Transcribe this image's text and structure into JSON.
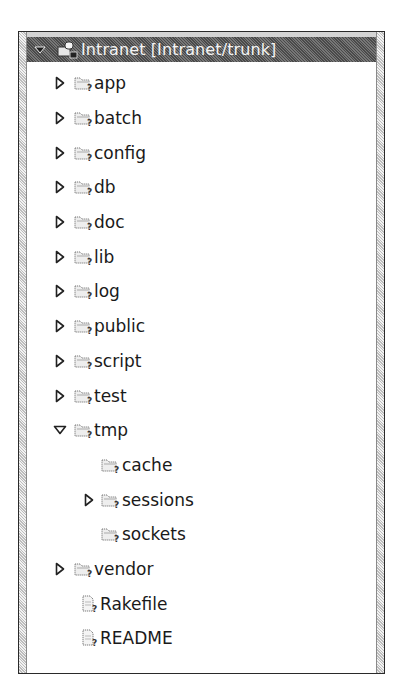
{
  "project": {
    "title": "Intranet [Intranet/trunk]",
    "expanded": true,
    "icon": "svn-project-icon"
  },
  "tree": {
    "items": [
      {
        "label": "app",
        "level": 1,
        "type": "folder",
        "twisty": "collapsed",
        "status": "unversioned"
      },
      {
        "label": "batch",
        "level": 1,
        "type": "folder",
        "twisty": "collapsed",
        "status": "unversioned"
      },
      {
        "label": "config",
        "level": 1,
        "type": "folder",
        "twisty": "collapsed",
        "status": "unversioned"
      },
      {
        "label": "db",
        "level": 1,
        "type": "folder",
        "twisty": "collapsed",
        "status": "unversioned"
      },
      {
        "label": "doc",
        "level": 1,
        "type": "folder",
        "twisty": "collapsed",
        "status": "unversioned"
      },
      {
        "label": "lib",
        "level": 1,
        "type": "folder",
        "twisty": "collapsed",
        "status": "unversioned"
      },
      {
        "label": "log",
        "level": 1,
        "type": "folder",
        "twisty": "collapsed",
        "status": "unversioned"
      },
      {
        "label": "public",
        "level": 1,
        "type": "folder",
        "twisty": "collapsed",
        "status": "unversioned"
      },
      {
        "label": "script",
        "level": 1,
        "type": "folder",
        "twisty": "collapsed",
        "status": "unversioned"
      },
      {
        "label": "test",
        "level": 1,
        "type": "folder",
        "twisty": "collapsed",
        "status": "unversioned"
      },
      {
        "label": "tmp",
        "level": 1,
        "type": "folder",
        "twisty": "expanded",
        "status": "unversioned"
      },
      {
        "label": "cache",
        "level": 2,
        "type": "folder",
        "twisty": "none",
        "status": "unversioned"
      },
      {
        "label": "sessions",
        "level": 2,
        "type": "folder",
        "twisty": "collapsed",
        "status": "unversioned"
      },
      {
        "label": "sockets",
        "level": 2,
        "type": "folder",
        "twisty": "none",
        "status": "unversioned"
      },
      {
        "label": "vendor",
        "level": 1,
        "type": "folder",
        "twisty": "collapsed",
        "status": "unversioned"
      },
      {
        "label": "Rakefile",
        "level": 1,
        "type": "file",
        "twisty": "none",
        "status": "unversioned"
      },
      {
        "label": "README",
        "level": 1,
        "type": "file",
        "twisty": "none",
        "status": "unversioned"
      }
    ]
  },
  "colors": {
    "header_bg": "#5a5a5a",
    "header_text": "#f4f4f4",
    "text": "#1a1a1a",
    "frame_border": "#2a2a2a"
  }
}
